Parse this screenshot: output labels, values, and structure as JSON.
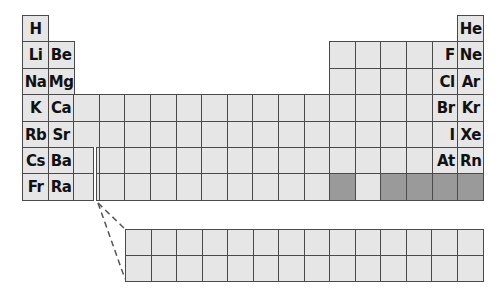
{
  "diagram": {
    "type": "periodic-table-outline",
    "colors": {
      "cell_fill": "#e6e6e6",
      "cell_dark": "#9a9a9a",
      "border": "#4a4a4a"
    },
    "labeled_elements": [
      {
        "symbol": "H",
        "period": 1,
        "group": 1
      },
      {
        "symbol": "He",
        "period": 1,
        "group": 18
      },
      {
        "symbol": "Li",
        "period": 2,
        "group": 1
      },
      {
        "symbol": "Be",
        "period": 2,
        "group": 2
      },
      {
        "symbol": "F",
        "period": 2,
        "group": 17
      },
      {
        "symbol": "Ne",
        "period": 2,
        "group": 18
      },
      {
        "symbol": "Na",
        "period": 3,
        "group": 1
      },
      {
        "symbol": "Mg",
        "period": 3,
        "group": 2
      },
      {
        "symbol": "Cl",
        "period": 3,
        "group": 17
      },
      {
        "symbol": "Ar",
        "period": 3,
        "group": 18
      },
      {
        "symbol": "K",
        "period": 4,
        "group": 1
      },
      {
        "symbol": "Ca",
        "period": 4,
        "group": 2
      },
      {
        "symbol": "Br",
        "period": 4,
        "group": 17
      },
      {
        "symbol": "Kr",
        "period": 4,
        "group": 18
      },
      {
        "symbol": "Rb",
        "period": 5,
        "group": 1
      },
      {
        "symbol": "Sr",
        "period": 5,
        "group": 2
      },
      {
        "symbol": "I",
        "period": 5,
        "group": 17
      },
      {
        "symbol": "Xe",
        "period": 5,
        "group": 18
      },
      {
        "symbol": "Cs",
        "period": 6,
        "group": 1
      },
      {
        "symbol": "Ba",
        "period": 6,
        "group": 2
      },
      {
        "symbol": "At",
        "period": 6,
        "group": 17
      },
      {
        "symbol": "Rn",
        "period": 6,
        "group": 18
      },
      {
        "symbol": "Fr",
        "period": 7,
        "group": 1
      },
      {
        "symbol": "Ra",
        "period": 7,
        "group": 2
      }
    ],
    "dark_cells": [
      {
        "period": 7,
        "group": 13
      },
      {
        "period": 7,
        "group": 15
      },
      {
        "period": 7,
        "group": 16
      },
      {
        "period": 7,
        "group": 17
      },
      {
        "period": 7,
        "group": 18
      }
    ],
    "f_block": {
      "rows": 2,
      "columns": 14
    }
  }
}
